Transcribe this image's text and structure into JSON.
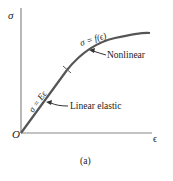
{
  "diagram": {
    "axes": {
      "y_label": "σ",
      "x_label": "ϵ",
      "origin_label": "O"
    },
    "curve": {
      "linear_equation": "σ = Eϵ",
      "nonlinear_equation": "σ = f(ϵ)"
    },
    "annotations": {
      "nonlinear": "Nonlinear",
      "linear_elastic": "Linear elastic"
    },
    "caption": "(a)",
    "colors": {
      "axis": "#777777",
      "curve": "#555555",
      "text": "#222222"
    }
  }
}
